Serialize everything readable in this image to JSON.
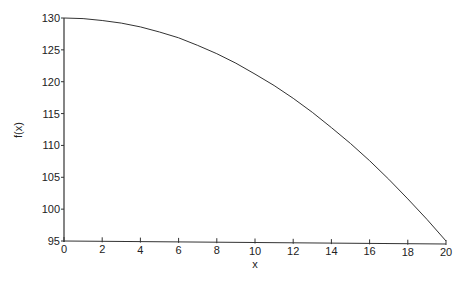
{
  "chart_data": {
    "type": "line",
    "title": "",
    "xlabel": "x",
    "ylabel": "f(x)",
    "xlim": [
      0,
      20
    ],
    "ylim": [
      95,
      130
    ],
    "grid": false,
    "legend": null,
    "x_ticks": [
      0,
      2,
      4,
      6,
      8,
      10,
      12,
      14,
      16,
      18,
      20
    ],
    "y_ticks": [
      95,
      100,
      105,
      110,
      115,
      120,
      125,
      130
    ],
    "series": [
      {
        "name": "f(x)",
        "color": "#333333",
        "x": [
          0,
          1,
          2,
          3,
          4,
          5,
          6,
          7,
          8,
          9,
          10,
          11,
          12,
          13,
          14,
          15,
          16,
          17,
          18,
          19,
          20
        ],
        "y": [
          130.0,
          129.9,
          129.6,
          129.2,
          128.6,
          127.8,
          126.9,
          125.7,
          124.4,
          122.9,
          121.2,
          119.4,
          117.4,
          115.2,
          112.8,
          110.3,
          107.6,
          104.7,
          101.6,
          98.4,
          95.0
        ]
      }
    ]
  },
  "plot": {
    "x_axis_label": "x",
    "y_axis_label": "f(x)"
  }
}
